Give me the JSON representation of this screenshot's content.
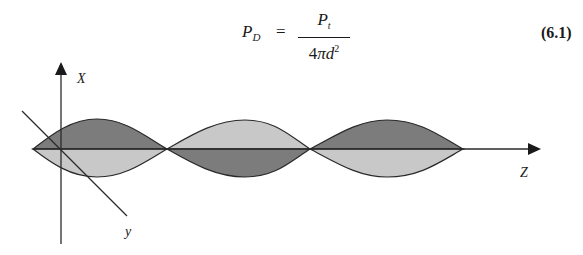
{
  "equation": {
    "lhs_symbol": "P",
    "lhs_subscript": "D",
    "equals": "=",
    "numerator_symbol": "P",
    "numerator_subscript": "t",
    "denominator_prefix": "4",
    "denominator_pi": "π",
    "denominator_var": "d",
    "denominator_exponent": "2",
    "number": "(6.1)"
  },
  "diagram": {
    "axes": {
      "x_label": "X",
      "y_label": "y",
      "z_label": "Z"
    },
    "colors": {
      "dark_fill": "#7c7c7c",
      "light_fill": "#c8c8c8",
      "stroke": "#2a2a2a"
    },
    "lobes": [
      {
        "index": 1,
        "top_shade": "dark",
        "bottom_shade": "light"
      },
      {
        "index": 2,
        "top_shade": "light",
        "bottom_shade": "dark"
      },
      {
        "index": 3,
        "top_shade": "dark",
        "bottom_shade": "light"
      }
    ]
  }
}
